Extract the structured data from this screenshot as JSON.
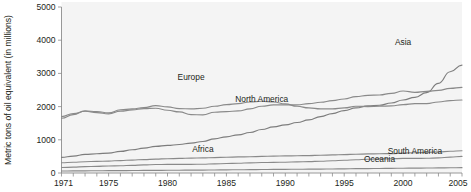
{
  "chart_data": {
    "type": "line",
    "title": "",
    "xlabel": "",
    "ylabel": "Metric tons of oil equivalent (in millions)",
    "xlim": [
      1971,
      2005
    ],
    "ylim": [
      0,
      5000
    ],
    "grid": false,
    "legend_position": "inline-labels",
    "y_ticks": [
      0,
      1000,
      2000,
      3000,
      4000,
      5000
    ],
    "y_tick_labels": [
      "0",
      "1000",
      "2000",
      "3000",
      "4000",
      "5000"
    ],
    "x_ticks": [
      1971,
      1972,
      1973,
      1974,
      1975,
      1976,
      1977,
      1978,
      1979,
      1980,
      1981,
      1982,
      1983,
      1984,
      1985,
      1986,
      1987,
      1988,
      1989,
      1990,
      1991,
      1992,
      1993,
      1994,
      1995,
      1996,
      1997,
      1998,
      1999,
      2000,
      2001,
      2002,
      2003,
      2004,
      2005
    ],
    "x_tick_labels": [
      "1971",
      "1975",
      "1980",
      "1985",
      "1990",
      "1995",
      "2000",
      "2005"
    ],
    "x_labeled_ticks": [
      1971,
      1975,
      1980,
      1985,
      1990,
      1995,
      2000,
      2005
    ],
    "x": [
      1971,
      1972,
      1973,
      1974,
      1975,
      1976,
      1977,
      1978,
      1979,
      1980,
      1981,
      1982,
      1983,
      1984,
      1985,
      1986,
      1987,
      1988,
      1989,
      1990,
      1991,
      1992,
      1993,
      1994,
      1995,
      1996,
      1997,
      1998,
      1999,
      2000,
      2001,
      2002,
      2003,
      2004,
      2005
    ],
    "series": [
      {
        "name": "Asia",
        "color": "#7d7d7d",
        "label_x": 2000,
        "label_y": 3850,
        "values": [
          470,
          510,
          560,
          580,
          600,
          650,
          700,
          750,
          800,
          830,
          860,
          900,
          950,
          1030,
          1090,
          1150,
          1220,
          1310,
          1390,
          1450,
          1520,
          1600,
          1700,
          1790,
          1880,
          1960,
          2020,
          2040,
          2110,
          2200,
          2280,
          2420,
          2700,
          3050,
          3250
        ]
      },
      {
        "name": "Europe",
        "color": "#8a8a8a",
        "label_x": 1982,
        "label_y": 2800,
        "values": [
          1650,
          1760,
          1870,
          1850,
          1810,
          1900,
          1930,
          1970,
          2030,
          1990,
          1940,
          1930,
          1950,
          2010,
          2060,
          2090,
          2140,
          2160,
          2140,
          2080,
          2010,
          1960,
          1930,
          1930,
          1960,
          2010,
          2000,
          2010,
          2020,
          2060,
          2090,
          2090,
          2140,
          2180,
          2200
        ]
      },
      {
        "name": "North America",
        "color": "#8a8a8a",
        "label_x": 1988,
        "label_y": 2150,
        "values": [
          1700,
          1790,
          1860,
          1820,
          1780,
          1860,
          1900,
          1940,
          1950,
          1890,
          1840,
          1760,
          1750,
          1830,
          1850,
          1870,
          1930,
          2010,
          2050,
          2050,
          2050,
          2090,
          2130,
          2180,
          2230,
          2300,
          2340,
          2350,
          2400,
          2470,
          2430,
          2460,
          2490,
          2550,
          2580
        ]
      },
      {
        "name": "Africa",
        "color": "#8a8a8a",
        "label_x": 1983,
        "label_y": 620,
        "values": [
          310,
          325,
          340,
          350,
          360,
          375,
          390,
          405,
          420,
          430,
          440,
          450,
          455,
          465,
          475,
          485,
          490,
          500,
          510,
          515,
          520,
          525,
          535,
          545,
          555,
          565,
          575,
          580,
          585,
          600,
          610,
          620,
          635,
          655,
          670
        ]
      },
      {
        "name": "South America",
        "color": "#8a8a8a",
        "label_x": 2001,
        "label_y": 560,
        "values": [
          165,
          175,
          190,
          200,
          210,
          220,
          230,
          245,
          255,
          260,
          260,
          262,
          265,
          275,
          285,
          295,
          305,
          315,
          320,
          325,
          335,
          345,
          355,
          370,
          385,
          400,
          415,
          425,
          430,
          440,
          440,
          445,
          455,
          480,
          500
        ]
      },
      {
        "name": "Oceania",
        "color": "#8a8a8a",
        "label_x": 1998,
        "label_y": 330,
        "values": [
          60,
          63,
          66,
          68,
          70,
          72,
          75,
          78,
          80,
          82,
          84,
          86,
          88,
          92,
          95,
          98,
          101,
          105,
          108,
          110,
          113,
          116,
          119,
          122,
          126,
          130,
          134,
          137,
          140,
          144,
          147,
          150,
          153,
          157,
          160
        ]
      }
    ]
  },
  "figure": {
    "background_color": "#ffffff",
    "plot_background_color": "#f4f4f4",
    "axis_color": "#8c8c8c"
  }
}
